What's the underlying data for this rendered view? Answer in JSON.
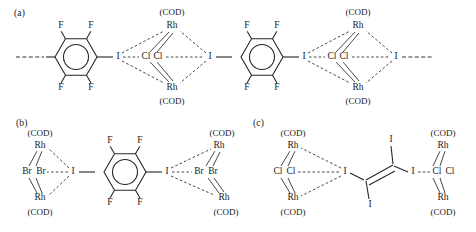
{
  "figure": {
    "panels": [
      {
        "id": "a",
        "label": "(a)",
        "description": "Halogen-bonded chain of tetrafluorodiiodobenzene with Rh2Cl2(COD)2 dimer units"
      },
      {
        "id": "b",
        "label": "(b)",
        "description": "Tetrafluorodiiodobenzene bridging two Rh2Br2(COD)2 dimer units"
      },
      {
        "id": "c",
        "label": "(c)",
        "description": "Tetraiodoethylene bridging two Rh2Cl2(COD)2 dimer units"
      }
    ],
    "atoms": {
      "fluorine": "F",
      "iodine": "I",
      "chlorine": "Cl",
      "bromine": "Br",
      "rhodium": "Rh"
    },
    "ligand": "(COD)",
    "panel_a": {
      "ring1_substituents": [
        "F",
        "F",
        "F",
        "F"
      ],
      "ring2_substituents": [
        "F",
        "F",
        "F",
        "F"
      ],
      "dimer1": {
        "top_ligand": "(COD)",
        "top_metal": "Rh",
        "bridge": [
          "Cl",
          "Cl"
        ],
        "bottom_metal": "Rh",
        "bottom_ligand": "(COD)",
        "donor_left": "I",
        "donor_right": "I"
      },
      "dimer2": {
        "top_ligand": "(COD)",
        "top_metal": "Rh",
        "bridge": [
          "Cl",
          "Cl"
        ],
        "bottom_metal": "Rh",
        "bottom_ligand": "(COD)",
        "donor_left": "I",
        "donor_right": "I"
      }
    },
    "panel_b": {
      "ring_substituents": [
        "F",
        "F",
        "F",
        "F"
      ],
      "left_dimer": {
        "top_ligand": "(COD)",
        "top_metal": "Rh",
        "bridge": [
          "Br",
          "Br"
        ],
        "bottom_metal": "Rh",
        "bottom_ligand": "(COD)",
        "donor": "I"
      },
      "right_dimer": {
        "top_ligand": "(COD)",
        "top_metal": "Rh",
        "bridge": [
          "Br",
          "Br"
        ],
        "bottom_metal": "Rh",
        "bottom_ligand": "(COD)",
        "donor": "I"
      }
    },
    "panel_c": {
      "core_substituents": [
        "I",
        "I",
        "I",
        "I"
      ],
      "left_dimer": {
        "top_ligand": "(COD)",
        "top_metal": "Rh",
        "bridge": [
          "Cl",
          "Cl"
        ],
        "bottom_metal": "Rh",
        "bottom_ligand": "(COD)",
        "donor": "I"
      },
      "right_dimer": {
        "top_ligand": "(COD)",
        "top_metal": "Rh",
        "bridge": [
          "Cl",
          "Cl"
        ],
        "bottom_metal": "Rh",
        "bottom_ligand": "(COD)",
        "donor": "I"
      }
    }
  },
  "caption": {
    "text": ""
  }
}
